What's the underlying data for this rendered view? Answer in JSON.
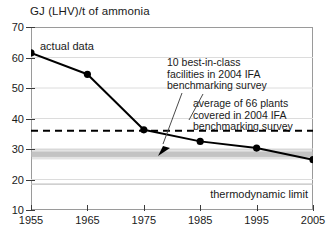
{
  "chart_data": {
    "type": "line",
    "title": "GJ (LHV)/t of ammonia",
    "xlabel": "",
    "ylabel": "GJ (LHV)/t of ammonia",
    "xlim": [
      1955,
      2005
    ],
    "ylim": [
      10,
      70
    ],
    "grid": true,
    "legend": "none",
    "x": [
      1955,
      1965,
      1975,
      1985,
      1995,
      2005
    ],
    "xticks": [
      "1955",
      "1965",
      "1975",
      "1985",
      "1995",
      "2005"
    ],
    "yticks": [
      "70",
      "60",
      "50",
      "40",
      "30",
      "20",
      "10"
    ],
    "series": [
      {
        "name": "actual data",
        "values": [
          61.5,
          54.5,
          36.3,
          32.5,
          30.3,
          26.5
        ],
        "marker": "filled-circle",
        "color": "#000000"
      }
    ],
    "reference_lines": [
      {
        "name": "average of 66 plants covered in 2004 IFA benchmarking survey",
        "value": 36.0,
        "style": "dashed",
        "color": "#000000"
      },
      {
        "name": "10 best-in-class facilities in 2004 IFA benchmarking survey",
        "value": 28.3,
        "style": "gray-band",
        "band_range": [
          27.4,
          29.2
        ],
        "color": "#b8b8b8"
      },
      {
        "name": "thermodynamic limit",
        "value": 18.5,
        "style": "solid-thin",
        "color": "#c0c0c0"
      }
    ],
    "annotations": [
      {
        "id": "actual-data",
        "text": "actual data",
        "target_x": 1955,
        "target_y": 61.5
      },
      {
        "id": "best-in-class",
        "text": "10 best-in-class\nfacilities in 2004 IFA\nbenchmarking survey",
        "target_y": 28.3,
        "has_arrow": true
      },
      {
        "id": "average-66",
        "text": "average of 66 plants\ncovered in 2004 IFA\nbenchmarking survey",
        "target_y": 36.0,
        "has_arrow": false
      },
      {
        "id": "thermodynamic-limit",
        "text": "thermodynamic limit",
        "target_y": 18.5,
        "has_arrow": false
      }
    ]
  },
  "axes": {
    "y_tick_labels": [
      "70",
      "60",
      "50",
      "40",
      "30",
      "20",
      "10"
    ],
    "y_tick_values": [
      70,
      60,
      50,
      40,
      30,
      20,
      10
    ],
    "x_tick_labels": [
      "1955",
      "1965",
      "1975",
      "1985",
      "1995",
      "2005"
    ],
    "x_tick_values": [
      1955,
      1965,
      1975,
      1985,
      1995,
      2005
    ]
  },
  "colors": {
    "data_line": "#000000",
    "grid": "#dcdcdc",
    "frame": "#9a9a9a",
    "band": "#b8b8b8",
    "thermo_line": "#c0c0c0",
    "text": "#1a1a1a",
    "background": "#ffffff"
  },
  "labels": {
    "title": "GJ (LHV)/t of ammonia",
    "actual_data": "actual data",
    "best_in_class_line1": "10 best-in-class",
    "best_in_class_line2": "facilities in 2004 IFA",
    "best_in_class_line3": "benchmarking survey",
    "average_line1": "average of 66 plants",
    "average_line2": "covered in 2004 IFA",
    "average_line3": "benchmarking survey",
    "thermodynamic_limit": "thermodynamic limit"
  }
}
